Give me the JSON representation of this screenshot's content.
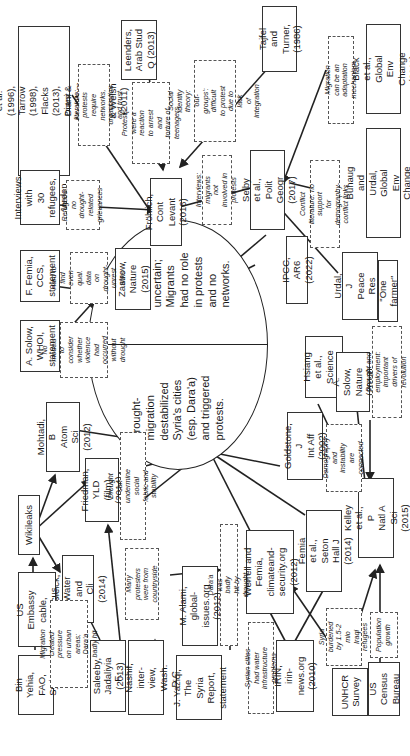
{
  "diagram": {
    "orientation": "rotated-90-ccw",
    "central_node": {
      "left_claim": "Drought-\nmigration\ndestabilized\nSyria's cities\n(esp. Dara'a)\nand triggered\nprotests.",
      "right_claim": "Migration-\nprotest link\nuncertain;\nMigrants\nhad no role\nin protests\nand no\nnetworks."
    },
    "sources": {
      "luhmann": "Luhmann (1988), McAdam et al.\n(1996), Tarrow (1998), Flacks\n(2013), Diani & McAdam (2008),\nChesters & Welsh (2011)",
      "leenders": "Leenders,\nArab Stud\nQ (2013)",
      "tajfel": "Tajfel and\nTurner,\n(1986)",
      "black": "Black et al., Global\nEnv Change (2011)",
      "interviews": "Interviews with\n30 refugees,\nJordan",
      "frohlich": "Fröhlich, Cont\nLevant (2016)",
      "selby": "Selby et al., Polit\nGeogr (2017)",
      "buhaug": "Buhaug and Urdal, Global\nEnv Change (2013)",
      "femia_ccs": "F. Femia, CCS,\nstatement",
      "solow_whoi": "A. Solow, WHOI,\nstatement",
      "zastrow": "Zastrow,\nNature (2015)",
      "ipcc": "IPCC, AR6 (2022)",
      "urdal": "Urdal, J Peace\nRes (2005)",
      "one_farmer": "\"One farmer\"",
      "hsiang": "Hsiang et al.,\nScience (2013)",
      "solow_nature": "A. Solow,\nNature (2013)",
      "goldstone": "Goldstone, J\nInt Aff (2002)",
      "kelley": "Kelley et al., P\nNatl A Sci (2015)",
      "mohtadi": "Mohtadi, B\nAtom Sci (2012)",
      "friedman": "Friedman, YLD\n(film) (2014)",
      "wikileaks": "Wikileaks",
      "gleick": "Gleick, Water\nand Cli (2014)",
      "bin_yehia": "Bin Yehia,\nFAO, Syria",
      "us_embassy": "US Embassy\ncable, Damascus",
      "saleeby": "Saleeby,\nJadaliyia (2013)",
      "nashif": "F. Nashif, inter-\nview, Wash. D.C.",
      "yaziqi": "J. Yaziqi, The\nSyria Report,\nstatement",
      "alami": "M. Alami, global-\nissues.org (2012)",
      "werrell": "Werrell and Femia,\nclimateand-\nsecurity.org (2012)",
      "femia_seton": "Femia et al., Seton\nHall J (2014)",
      "irin": "IRIN, irin-\nnews.org (2010)",
      "unhcr": "UNHCR\nSurvey",
      "us_census": "US Census\nBureau"
    },
    "notes": {
      "protest_lit": "Protest literature: protests\nrequire networks,\norganization and trust",
      "arrest": "Protests were a\nreaction to arrest and\ntorture of teenagers",
      "social_identity": "Social identity theory:\n'out-groups': difficult\nto protest due to lack\nof integration",
      "adaptation": "Migration can be an\nadaptation mechanism",
      "refugees": "Refugees: no\ndrought-related\ngrievances",
      "interviews_note": "Interviews: migrants\nnot involved in protests",
      "conflict_lit": "Conflict literature: no support\nfor demography-conflict links",
      "hard_to_find": "Hard to find\neven qual. data\non drought-\nunrest links",
      "no_models": "No models to\nconsider whether\nviolence had\noccurred without\ndrought",
      "drought_employment": "Drought and employment:\nimportant drivers of revolution",
      "demography": "Demography\nand instability\nare connected",
      "social_fabric": "Drought can undermine\nsocial fabric and stability",
      "migration_pressure": "Migration created\npressure on urban\nareas; Dara'a badly hit",
      "many_protesters": "Many protesters\nwere from\ncountryside",
      "daraa_hit": "Dara'a was badly hit by drought",
      "water_infra": "Syrian cities had water\ninfrastructure problems",
      "iraqi_refugees": "Syria burdened\nby 1.5-2 mio\nIraqi refugees",
      "population": "Population\ngrowth"
    }
  }
}
